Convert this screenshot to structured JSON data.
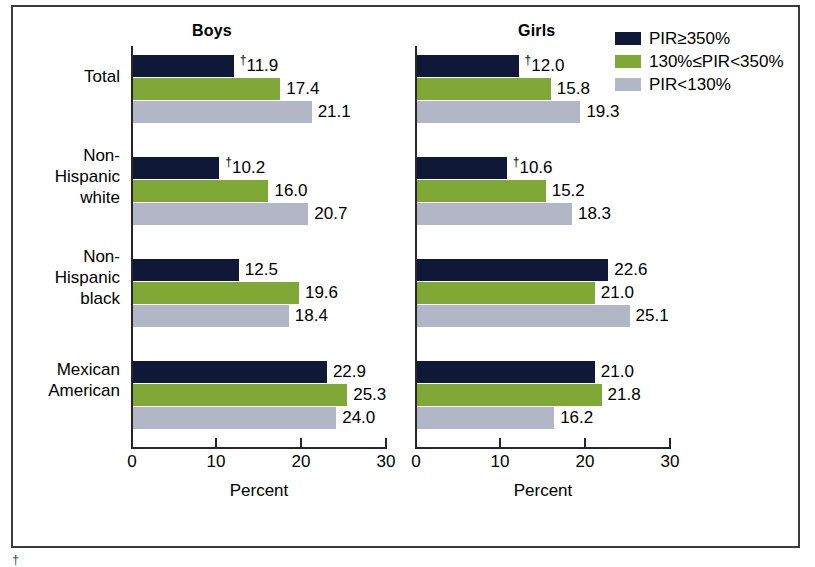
{
  "chart_data": {
    "type": "bar",
    "orientation": "horizontal",
    "title": "",
    "xlabel": "Percent",
    "ylabel": "",
    "xlim": [
      0,
      30
    ],
    "xticks": [
      0,
      10,
      20,
      30
    ],
    "xticklabels": [
      "0",
      "10",
      "20",
      "30"
    ],
    "grid": false,
    "legend_position": "top-right",
    "categories": [
      "Total",
      "Non-Hispanic white",
      "Non-Hispanic black",
      "Mexican American"
    ],
    "panels": [
      {
        "name": "Boys",
        "series": [
          {
            "name": "PIR≥350%",
            "color": "#101838",
            "values": [
              11.9,
              10.2,
              12.5,
              22.9
            ],
            "flags": [
              "†",
              "†",
              "",
              ""
            ]
          },
          {
            "name": "130%≤PIR<350%",
            "color": "#7fa837",
            "values": [
              17.4,
              16.0,
              19.6,
              25.3
            ],
            "flags": [
              "",
              "",
              "",
              ""
            ]
          },
          {
            "name": "PIR<130%",
            "color": "#b2b6c6",
            "values": [
              21.1,
              20.7,
              18.4,
              24.0
            ],
            "flags": [
              "",
              "",
              "",
              ""
            ]
          }
        ]
      },
      {
        "name": "Girls",
        "series": [
          {
            "name": "PIR≥350%",
            "color": "#101838",
            "values": [
              12.0,
              10.6,
              22.6,
              21.0
            ],
            "flags": [
              "†",
              "†",
              "",
              ""
            ]
          },
          {
            "name": "130%≤PIR<350%",
            "color": "#7fa837",
            "values": [
              15.8,
              15.2,
              21.0,
              21.8
            ],
            "flags": [
              "",
              "",
              "",
              ""
            ]
          },
          {
            "name": "PIR<130%",
            "color": "#b2b6c6",
            "values": [
              19.3,
              18.3,
              25.1,
              16.2
            ],
            "flags": [
              "",
              "",
              "",
              ""
            ]
          }
        ]
      }
    ]
  },
  "panels": {
    "boys": {
      "title": "Boys"
    },
    "girls": {
      "title": "Girls"
    }
  },
  "axis": {
    "title": "Percent",
    "tick_0": "0",
    "tick_10": "10",
    "tick_20": "20",
    "tick_30": "30"
  },
  "categories": {
    "total": "Total",
    "nh_white_l1": "Non-",
    "nh_white_l2": "Hispanic",
    "nh_white_l3": "white",
    "nh_black_l1": "Non-",
    "nh_black_l2": "Hispanic",
    "nh_black_l3": "black",
    "mex_l1": "Mexican",
    "mex_l2": "American"
  },
  "legend": {
    "items": [
      {
        "label": "PIR≥350%",
        "color": "#101838",
        "swatch_name": "legend-swatch-pir-high"
      },
      {
        "label": "130%≤PIR<350%",
        "color": "#7fa837",
        "swatch_name": "legend-swatch-pir-mid"
      },
      {
        "label": "PIR<130%",
        "color": "#b2b6c6",
        "swatch_name": "legend-swatch-pir-low"
      }
    ]
  },
  "labels": {
    "boys": {
      "total": {
        "s0": "†11.9",
        "s1": "17.4",
        "s2": "21.1"
      },
      "nh_white": {
        "s0": "†10.2",
        "s1": "16.0",
        "s2": "20.7"
      },
      "nh_black": {
        "s0": "12.5",
        "s1": "19.6",
        "s2": "18.4"
      },
      "mexican": {
        "s0": "22.9",
        "s1": "25.3",
        "s2": "24.0"
      }
    },
    "girls": {
      "total": {
        "s0": "†12.0",
        "s1": "15.8",
        "s2": "19.3"
      },
      "nh_white": {
        "s0": "†10.6",
        "s1": "15.2",
        "s2": "18.3"
      },
      "nh_black": {
        "s0": "22.6",
        "s1": "21.0",
        "s2": "25.1"
      },
      "mexican": {
        "s0": "21.0",
        "s1": "21.8",
        "s2": "16.2"
      }
    }
  },
  "footnote": {
    "text": "†"
  }
}
